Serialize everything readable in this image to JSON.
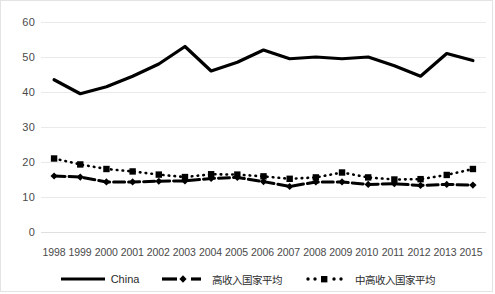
{
  "chart_data": {
    "type": "line",
    "title": "",
    "xlabel": "",
    "ylabel": "",
    "ylim": [
      0,
      60
    ],
    "ytick_values": [
      60,
      50,
      40,
      30,
      20,
      10,
      0
    ],
    "grid": true,
    "legend_position": "bottom",
    "categories": [
      "1998",
      "1999",
      "2000",
      "2001",
      "2002",
      "2003",
      "2004",
      "2005",
      "2006",
      "2007",
      "2008",
      "2009",
      "2010",
      "2011",
      "2012",
      "2013",
      "2015"
    ],
    "series": [
      {
        "name": "China",
        "style": "solid",
        "marker": "none",
        "color": "#000000",
        "values": [
          43.5,
          39.5,
          41.5,
          44.5,
          48.0,
          53.0,
          46.0,
          48.5,
          52.0,
          49.5,
          50.0,
          49.5,
          50.0,
          47.5,
          44.5,
          51.0,
          49.0
        ]
      },
      {
        "name": "高收入国家平均",
        "style": "dash-dot",
        "marker": "diamond",
        "color": "#000000",
        "values": [
          16.0,
          15.7,
          14.3,
          14.3,
          14.5,
          14.6,
          15.3,
          15.6,
          14.4,
          13.0,
          14.3,
          14.3,
          13.6,
          13.8,
          13.3,
          13.6,
          13.4
        ]
      },
      {
        "name": "中高收入国家平均",
        "style": "dotted",
        "marker": "square",
        "color": "#000000",
        "values": [
          21.0,
          19.3,
          18.0,
          17.3,
          16.4,
          15.7,
          16.5,
          16.4,
          15.9,
          15.2,
          15.6,
          17.0,
          15.6,
          15.0,
          15.1,
          16.3,
          18.0
        ]
      }
    ]
  },
  "legend": {
    "items": [
      {
        "label": "China",
        "key": "solid-line-key"
      },
      {
        "label": "高收入国家平均",
        "key": "dash-diamond-key"
      },
      {
        "label": "中高收入国家平均",
        "key": "dot-square-key"
      }
    ]
  }
}
